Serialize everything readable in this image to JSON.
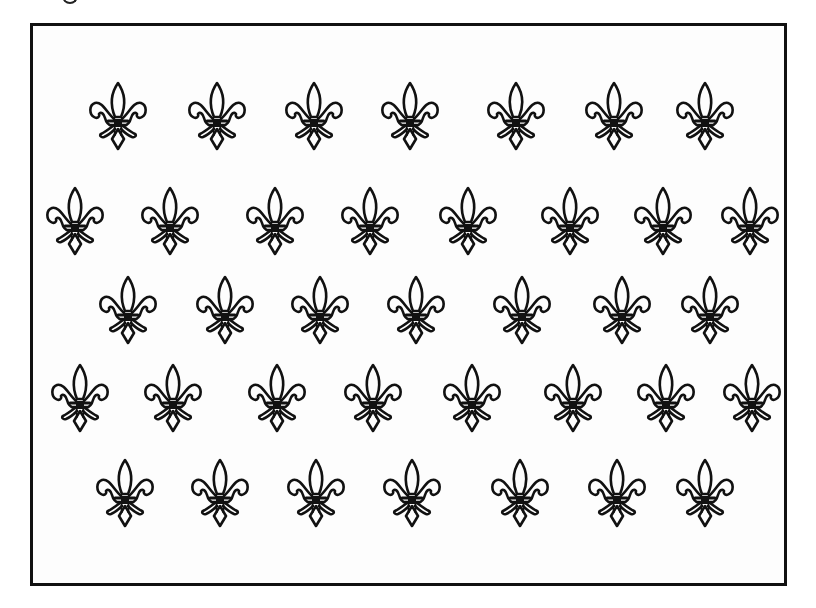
{
  "figure": {
    "frame_color": "#111111",
    "motif_color": "#111111",
    "background_color": "#ffffff",
    "motif_icon": "fleur-de-lis-icon",
    "motif_size": {
      "width": 58,
      "height": 70
    },
    "rows": [
      {
        "y": 116,
        "x": [
          118,
          217,
          314,
          410,
          516,
          614,
          705
        ]
      },
      {
        "y": 221,
        "x": [
          75,
          170,
          275,
          370,
          468,
          570,
          663,
          750
        ]
      },
      {
        "y": 310,
        "x": [
          128,
          225,
          320,
          416,
          522,
          622,
          710
        ]
      },
      {
        "y": 398,
        "x": [
          80,
          173,
          277,
          373,
          472,
          573,
          666,
          752
        ]
      },
      {
        "y": 493,
        "x": [
          125,
          220,
          316,
          412,
          520,
          617,
          705
        ]
      }
    ],
    "total_motifs": 37
  }
}
